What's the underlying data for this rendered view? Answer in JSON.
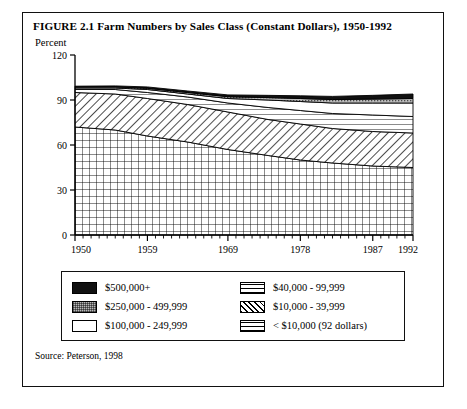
{
  "figure": {
    "title": "FIGURE 2.1  Farm Numbers by Sales Class (Constant Dollars), 1950-1992",
    "y_axis_label": "Percent",
    "source": "Source: Peterson, 1998"
  },
  "legend": {
    "left": [
      {
        "label": "$500,000+",
        "pattern": "solid-black"
      },
      {
        "label": "$250,000 - 499,999",
        "pattern": "gray-stipple"
      },
      {
        "label": "$100,000 - 249,999",
        "pattern": "white"
      }
    ],
    "right": [
      {
        "label": "$40,000 - 99,999",
        "pattern": "horizontal-lines"
      },
      {
        "label": "$10,000 - 39,999",
        "pattern": "diagonal-hatch"
      },
      {
        "label": "< $10,000 (92 dollars)",
        "pattern": "grid-crosshatch"
      }
    ]
  },
  "chart_data": {
    "type": "area",
    "title": "FIGURE 2.1  Farm Numbers by Sales Class (Constant Dollars), 1950-1992",
    "xlabel": "",
    "ylabel": "Percent",
    "xlim": [
      1950,
      1992
    ],
    "ylim": [
      0,
      120
    ],
    "yticks": [
      0,
      30,
      60,
      90,
      120
    ],
    "xticks": [
      1950,
      1959,
      1969,
      1978,
      1987,
      1992
    ],
    "xtick_labels": [
      "1950",
      "1959",
      "1969",
      "1978",
      "1987",
      "1992"
    ],
    "ytick_labels": [
      "0",
      "30",
      "60",
      "90",
      "120"
    ],
    "grid": false,
    "legend_position": "below-plot",
    "stacked": true,
    "stack_order_bottom_to_top": [
      "< $10,000 (92 dollars)",
      "$10,000 - 39,999",
      "$40,000 - 99,999",
      "$100,000 - 249,999",
      "$250,000 - 499,999",
      "$500,000+"
    ],
    "x": [
      1950,
      1955,
      1959,
      1964,
      1969,
      1974,
      1978,
      1982,
      1987,
      1992
    ],
    "series": [
      {
        "name": "< $10,000 (92 dollars)",
        "pattern": "grid-crosshatch",
        "values": [
          72,
          70,
          66,
          62,
          57,
          53,
          50,
          48,
          46,
          45
        ]
      },
      {
        "name": "$10,000 - 39,999",
        "pattern": "diagonal-hatch",
        "values": [
          23,
          24,
          25,
          25,
          25,
          24,
          24,
          23,
          23,
          23
        ]
      },
      {
        "name": "$40,000 - 99,999",
        "pattern": "horizontal-lines",
        "values": [
          2,
          3,
          4,
          5,
          6,
          8,
          9,
          10,
          11,
          11
        ]
      },
      {
        "name": "$100,000 - 249,999",
        "pattern": "white",
        "values": [
          1,
          1,
          2,
          2,
          3,
          5,
          6,
          7,
          8,
          9
        ]
      },
      {
        "name": "$250,000 - 499,999",
        "pattern": "gray-stipple",
        "values": [
          0.6,
          0.7,
          0.8,
          1,
          1.2,
          1.6,
          2,
          2.3,
          2.6,
          3
        ]
      },
      {
        "name": "$500,000+",
        "pattern": "solid-black",
        "values": [
          0.6,
          0.7,
          0.9,
          1,
          1.2,
          1.5,
          1.8,
          2.1,
          2.5,
          3
        ]
      }
    ],
    "totals": [
      99.2,
      99.4,
      98.7,
      96.0,
      93.4,
      93.1,
      92.8,
      92.4,
      93.1,
      94.0
    ]
  }
}
